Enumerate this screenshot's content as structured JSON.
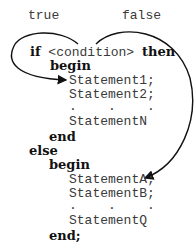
{
  "labels": {
    "true": "true",
    "false": "false"
  },
  "code": {
    "if": "if",
    "condition": "<condition>",
    "then": "then",
    "begin1": "begin",
    "stmt1": "Statement1;",
    "stmt2": "Statement2;",
    "dots1": ".    .    .",
    "stmtN": "StatementN",
    "end1": "end",
    "else": "else",
    "begin2": "begin",
    "stmtA": "StatementA;",
    "stmtB": "StatementB;",
    "dots2": ".    .    .",
    "stmtQ": "StatementQ",
    "end2": "end;"
  },
  "colors": {
    "text": "#3a3a3a",
    "keyword": "#111111",
    "arrow": "#111111"
  }
}
